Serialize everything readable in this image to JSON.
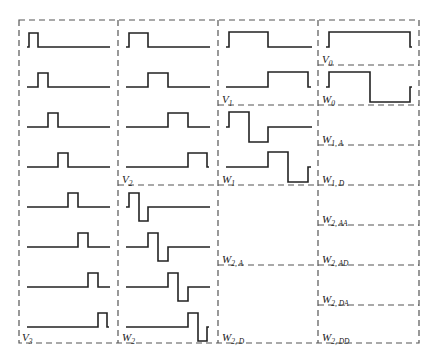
{
  "labels": {
    "V0": {
      "main": "V",
      "sub": "0"
    },
    "W0": {
      "main": "W",
      "sub": "0"
    },
    "V1": {
      "main": "V",
      "sub": "1"
    },
    "W1": {
      "main": "W",
      "sub": "1"
    },
    "W1A": {
      "main": "W",
      "sub": "1, A"
    },
    "W1D": {
      "main": "W",
      "sub": "1, D"
    },
    "V2": {
      "main": "V",
      "sub": "2"
    },
    "W2": {
      "main": "W",
      "sub": "2"
    },
    "W2A": {
      "main": "W",
      "sub": "2, A"
    },
    "W2D": {
      "main": "W",
      "sub": "2, D"
    },
    "W2AA": {
      "main": "W",
      "sub": "2, AA"
    },
    "W2AD": {
      "main": "W",
      "sub": "2, AD"
    },
    "W2DA": {
      "main": "W",
      "sub": "2, DA"
    },
    "W2DD": {
      "main": "W",
      "sub": "2, DD"
    },
    "V3": {
      "main": "V",
      "sub": "3"
    }
  },
  "columns": [
    {
      "name": "V3",
      "basis_functions": 8,
      "pulse_width": "1/8"
    },
    {
      "name": "V2 / W2",
      "basis_functions": 8,
      "pulse_width": "1/4"
    },
    {
      "name": "V1 / W1 / W2,A / W2,D",
      "basis_functions": 4,
      "pulse_width": "1/2"
    },
    {
      "name": "V0 / W0 / W1,A / W1,D / W2,AA / W2,AD / W2,DA / W2,DD",
      "basis_functions": 2,
      "pulse_width": "1"
    }
  ]
}
